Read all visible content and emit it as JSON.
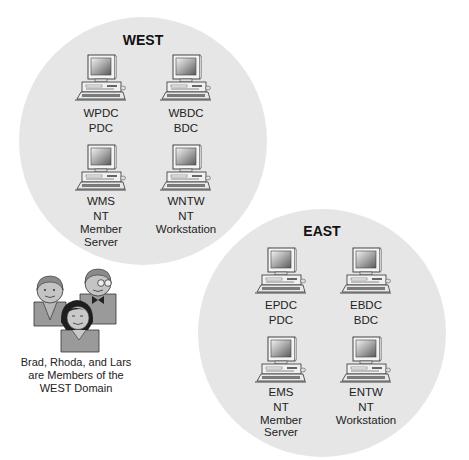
{
  "domains": [
    {
      "name": "WEST",
      "computers": [
        {
          "hostname": "WPDC",
          "role_lines": [
            "PDC"
          ]
        },
        {
          "hostname": "WBDC",
          "role_lines": [
            "BDC"
          ]
        },
        {
          "hostname": "WMS",
          "role_lines": [
            "NT",
            "Member",
            "Server"
          ]
        },
        {
          "hostname": "WNTW",
          "role_lines": [
            "NT",
            "Workstation"
          ]
        }
      ]
    },
    {
      "name": "EAST",
      "computers": [
        {
          "hostname": "EPDC",
          "role_lines": [
            "PDC"
          ]
        },
        {
          "hostname": "EBDC",
          "role_lines": [
            "BDC"
          ]
        },
        {
          "hostname": "EMS",
          "role_lines": [
            "NT",
            "Member",
            "Server"
          ]
        },
        {
          "hostname": "ENTW",
          "role_lines": [
            "NT",
            "Workstation"
          ]
        }
      ]
    }
  ],
  "users": {
    "icon": "group-of-people-icon",
    "names": [
      "Brad",
      "Rhoda",
      "Lars"
    ],
    "caption_lines": [
      "Brad, Rhoda, and Lars",
      "are Members of the",
      "WEST Domain"
    ]
  },
  "colors": {
    "domain_fill": "#e6e6e6",
    "monitor_screen": "#8c8c8c",
    "person_fill": "#9a9a9a"
  }
}
